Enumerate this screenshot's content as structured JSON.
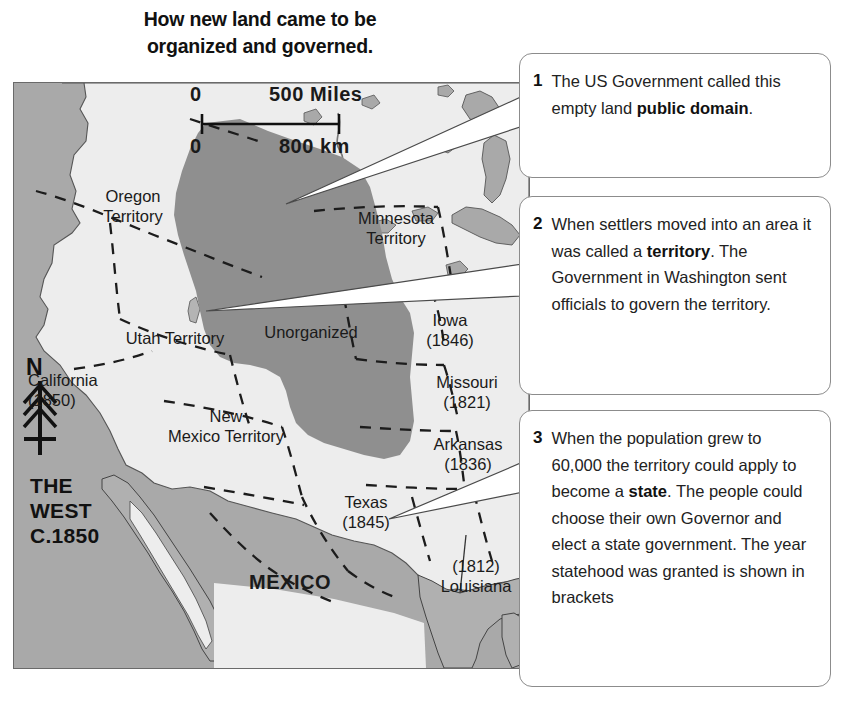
{
  "title": {
    "line1": "How new land came to be",
    "line2": "organized and governed."
  },
  "map": {
    "scale": {
      "miles_zero": "0",
      "miles_label": "500 Miles",
      "km_zero": "0",
      "km_label": "800 km"
    },
    "compass": {
      "north": "N"
    },
    "corner_label": {
      "line1": "THE",
      "line2": "WEST",
      "line3": "C.1850"
    },
    "regions": [
      {
        "id": "oregon-territory",
        "line1": "Oregon",
        "line2": "Territory"
      },
      {
        "id": "minnesota-territory",
        "line1": "Minnesota",
        "line2": "Territory"
      },
      {
        "id": "utah-territory",
        "line1": "Utah Territory",
        "line2": ""
      },
      {
        "id": "unorganized",
        "line1": "Unorganized",
        "line2": ""
      },
      {
        "id": "iowa",
        "line1": "Iowa",
        "line2": "(1846)"
      },
      {
        "id": "california",
        "line1": "California",
        "line2": "(1850)"
      },
      {
        "id": "new-mexico-territory",
        "line1": "New",
        "line2": "Mexico Territory"
      },
      {
        "id": "missouri",
        "line1": "Missouri",
        "line2": "(1821)"
      },
      {
        "id": "arkansas",
        "line1": "Arkansas",
        "line2": "(1836)"
      },
      {
        "id": "texas",
        "line1": "Texas",
        "line2": "(1845)"
      },
      {
        "id": "louisiana",
        "line1": "(1812)",
        "line2": "Louisiana"
      },
      {
        "id": "mexico",
        "line1": "MEXICO",
        "line2": ""
      }
    ]
  },
  "callouts": [
    {
      "number": "1",
      "text_before": "The US Government called this empty land ",
      "text_bold": "public domain",
      "text_after": "."
    },
    {
      "number": "2",
      "text_before": "When settlers moved into an area it was called a ",
      "text_bold": "territory",
      "text_after": ". The Government in Washington sent officials to govern the territory."
    },
    {
      "number": "3",
      "text_before": "When the population grew to 60,000 the territory could apply to become a ",
      "text_bold": "state",
      "text_after": ". The people could choose their own Governor and elect a state government. The year statehood was granted is shown in brackets"
    }
  ],
  "colors": {
    "ocean": "#a8a8a8",
    "land": "#ededed",
    "unorganized": "#8f8f8f",
    "border": "#6a6a6a",
    "callout_border": "#8c8c8c",
    "text": "#1a1a1a"
  }
}
